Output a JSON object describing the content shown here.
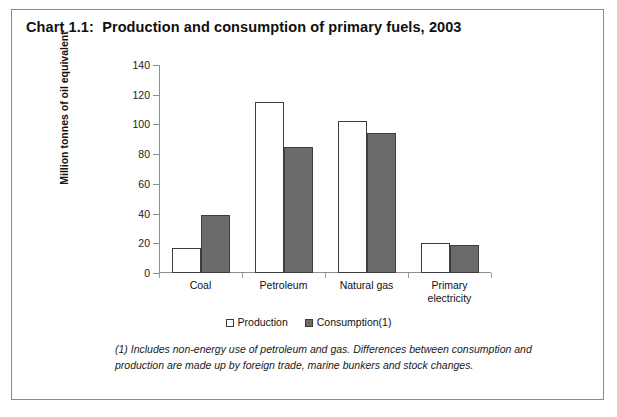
{
  "panel": {
    "title": "Chart 1.1:  Production and consumption of primary fuels, 2003"
  },
  "legend": {
    "production_label": "Production",
    "consumption_label": "Consumption(1)",
    "production_swatch": "open-square-icon",
    "consumption_swatch": "filled-square-icon"
  },
  "footnote": {
    "text": "(1) Includes non-energy use of petroleum and gas. Differences between consumption and production are made up by foreign trade, marine bunkers and stock changes."
  },
  "colors": {
    "production_fill": "#ffffff",
    "consumption_fill": "#6b6b6b",
    "bar_outline": "#3d3d3d",
    "axis": "#8e8e8e",
    "panel_border": "#8a8a8a",
    "text": "#111111"
  },
  "chart_data": {
    "type": "bar",
    "title": "Chart 1.1:  Production and consumption of primary fuels, 2003",
    "xlabel": "",
    "ylabel": "Million tonnes of oil equivalent",
    "ylim": [
      0,
      140
    ],
    "yticks": [
      0,
      20,
      40,
      60,
      80,
      100,
      120,
      140
    ],
    "ytick_labels": [
      "0",
      "20",
      "40",
      "60",
      "80",
      "100",
      "120",
      "140"
    ],
    "grid": false,
    "legend_position": "bottom-center",
    "categories": [
      "Coal",
      "Petroleum",
      "Natural gas",
      "Primary electricity"
    ],
    "category_label_lines": [
      [
        "Coal"
      ],
      [
        "Petroleum"
      ],
      [
        "Natural gas"
      ],
      [
        "Primary",
        "electricity"
      ]
    ],
    "series": [
      {
        "name": "Production",
        "values": [
          17,
          115,
          102,
          20
        ]
      },
      {
        "name": "Consumption(1)",
        "values": [
          39,
          85,
          94,
          19
        ]
      }
    ]
  }
}
